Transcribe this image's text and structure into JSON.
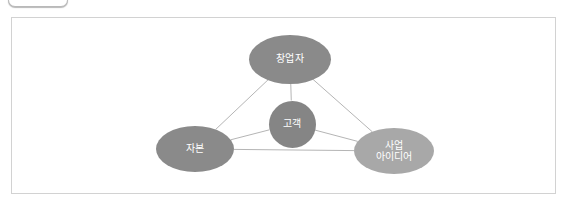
{
  "top_fragment": {
    "name": "cut-off-rounded-control"
  },
  "frame": {
    "border_color": "#d2d2d2",
    "background": "#ffffff"
  },
  "diagram": {
    "title": "",
    "background": "#ffffff",
    "edge_color": "#b5b5b5",
    "nodes": [
      {
        "id": "founder",
        "label": "창업자",
        "shape": "ellipse",
        "cx": 278,
        "cy": 41,
        "rx": 41,
        "ry": 24.5,
        "fill": "#8a8a8a",
        "text_color": "#ffffff"
      },
      {
        "id": "customer",
        "label": "고객",
        "shape": "circle",
        "cx": 280,
        "cy": 106,
        "rx": 23.5,
        "ry": 23.5,
        "fill": "#858585",
        "text_color": "#ffffff"
      },
      {
        "id": "capital",
        "label": "자본",
        "shape": "ellipse",
        "cx": 183,
        "cy": 131,
        "rx": 39,
        "ry": 23,
        "fill": "#8a8a8a",
        "text_color": "#ffffff"
      },
      {
        "id": "business-idea",
        "label": "사업\n아이디어",
        "shape": "ellipse",
        "cx": 382,
        "cy": 133,
        "rx": 40,
        "ry": 23,
        "fill": "#a8a8a8",
        "text_color": "#ffffff"
      }
    ],
    "edges": [
      {
        "from": "founder",
        "to": "capital"
      },
      {
        "from": "founder",
        "to": "business-idea"
      },
      {
        "from": "capital",
        "to": "business-idea"
      },
      {
        "from": "founder",
        "to": "customer"
      },
      {
        "from": "customer",
        "to": "capital"
      },
      {
        "from": "customer",
        "to": "business-idea"
      }
    ]
  }
}
